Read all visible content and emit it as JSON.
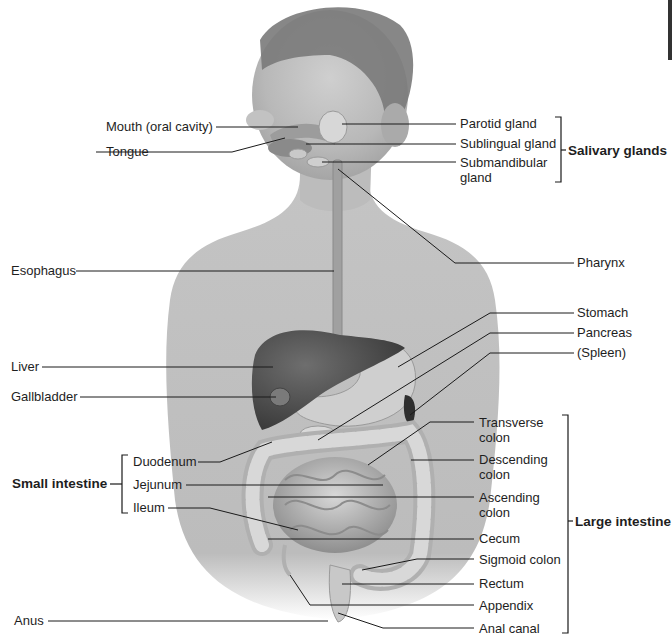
{
  "diagram": {
    "left_labels": {
      "mouth": "Mouth (oral cavity)",
      "tongue": "Tongue",
      "esophagus": "Esophagus",
      "liver": "Liver",
      "gallbladder": "Gallbladder",
      "anus": "Anus"
    },
    "small_intestine": {
      "group_label": "Small intestine",
      "parts": [
        "Duodenum",
        "Jejunum",
        "Ileum"
      ]
    },
    "salivary_glands": {
      "group_label": "Salivary glands",
      "parts": [
        "Parotid gland",
        "Sublingual gland",
        "Submandibular gland"
      ]
    },
    "right_labels": {
      "pharynx": "Pharynx",
      "stomach": "Stomach",
      "pancreas": "Pancreas",
      "spleen": "(Spleen)"
    },
    "large_intestine": {
      "group_label": "Large intestine",
      "parts": [
        "Transverse colon",
        "Descending colon",
        "Ascending colon",
        "Cecum",
        "Sigmoid colon",
        "Rectum",
        "Appendix",
        "Anal canal"
      ]
    },
    "colors": {
      "background": "#ffffff",
      "skin": "#bdbdbd",
      "hair": "#7a7a7a",
      "liver": "#5a5a5a",
      "organ_light": "#d0d0d0",
      "leader_line": "#1a1a1a"
    }
  }
}
